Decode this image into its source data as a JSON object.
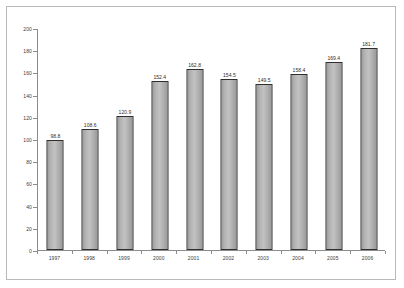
{
  "chart_data": {
    "type": "bar",
    "title": "",
    "subtitle": "",
    "xlabel": "",
    "ylabel": "",
    "categories": [
      "1997",
      "1998",
      "1999",
      "2000",
      "2001",
      "2002",
      "2003",
      "2004",
      "2005",
      "2006"
    ],
    "values": [
      98.8,
      108.6,
      120.9,
      152.4,
      162.8,
      154.5,
      149.5,
      158.4,
      169.4,
      181.7
    ],
    "data_labels": [
      "98.8",
      "108.6",
      "120.9",
      "152.4",
      "162.8",
      "154.5",
      "149.5",
      "158.4",
      "169.4",
      "181.7"
    ],
    "ylim": [
      0,
      200
    ],
    "ytick_step": 20,
    "ytick_labels": [
      "0",
      "20",
      "40",
      "60",
      "80",
      "100",
      "120",
      "140",
      "160",
      "180",
      "200"
    ],
    "grid": false,
    "legend": false,
    "legend_position": "none",
    "series": [
      {
        "name": "",
        "values": [
          98.8,
          108.6,
          120.9,
          152.4,
          162.8,
          154.5,
          149.5,
          158.4,
          169.4,
          181.7
        ]
      }
    ]
  },
  "style": {
    "bar_fill": "#b4b4b4",
    "bar_border": "#2e2e2e",
    "axis_color": "#8c8c8c",
    "frame_color": "#b9b9b9",
    "text_color": "#3b3b3b",
    "background": "#ffffff"
  }
}
